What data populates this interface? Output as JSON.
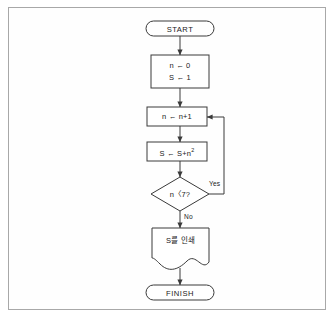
{
  "diagram": {
    "type": "flowchart",
    "orientation": "top-to-bottom",
    "frame_color": "#a8a8a8",
    "line_color": "#3a3a3a",
    "shape_fill": "#ffffff",
    "text_color": "#1a1a1a"
  },
  "nodes": {
    "start": {
      "label": "START",
      "shape": "terminator"
    },
    "init": {
      "line1": "n ← 0",
      "line2": "S ← 1",
      "shape": "process"
    },
    "increment": {
      "label": "n ← n+1",
      "shape": "process"
    },
    "accumulate": {
      "label_base": "S ← S+n",
      "label_exponent": "2",
      "shape": "process"
    },
    "decision": {
      "label": "n〈7?",
      "shape": "decision"
    },
    "print": {
      "label": "S를 인쇄",
      "shape": "document"
    },
    "finish": {
      "label": "FINISH",
      "shape": "terminator"
    }
  },
  "edges": {
    "yes_label": "Yes",
    "no_label": "No"
  }
}
